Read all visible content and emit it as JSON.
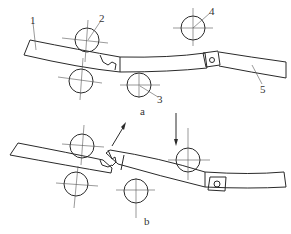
{
  "diagram": {
    "type": "mechanical-schematic",
    "subfigures": [
      {
        "id": "a",
        "label": "a",
        "description": "Chain link strip passing between rollers, joint closed"
      },
      {
        "id": "b",
        "label": "b",
        "description": "Chain link strip passing between rollers, joint opening with arrow indicating motion"
      }
    ],
    "part_labels": [
      {
        "number": "1",
        "name": "strip"
      },
      {
        "number": "2",
        "name": "upper roller"
      },
      {
        "number": "3",
        "name": "lower roller"
      },
      {
        "number": "4",
        "name": "upper roller"
      },
      {
        "number": "5",
        "name": "link segment"
      }
    ],
    "arrows": [
      {
        "subfigure": "b",
        "direction": "up-right"
      },
      {
        "subfigure": "b",
        "direction": "down"
      }
    ],
    "colors": {
      "line": "#2a2a2a",
      "background": "#ffffff"
    }
  }
}
